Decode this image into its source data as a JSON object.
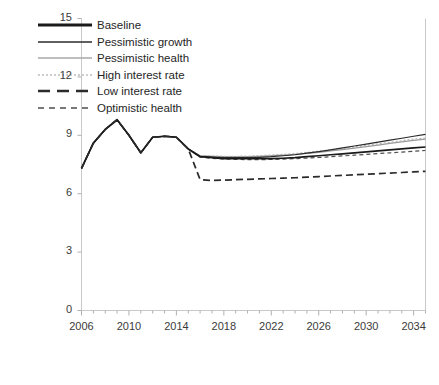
{
  "chart_data": {
    "type": "line",
    "title": "",
    "xlabel": "",
    "ylabel": "",
    "xlim": [
      2006,
      2035
    ],
    "ylim": [
      0,
      15
    ],
    "yticks": [
      0,
      3,
      6,
      9,
      12,
      15
    ],
    "xticks": [
      2006,
      2010,
      2014,
      2018,
      2022,
      2026,
      2030,
      2034
    ],
    "xtick_minor_step": 1,
    "grid": false,
    "legend_position": "top-left",
    "x": [
      2006,
      2007,
      2008,
      2009,
      2010,
      2011,
      2012,
      2013,
      2014,
      2015,
      2016,
      2017,
      2018,
      2019,
      2020,
      2021,
      2022,
      2023,
      2024,
      2025,
      2026,
      2027,
      2028,
      2029,
      2030,
      2031,
      2032,
      2033,
      2034,
      2035
    ],
    "series": [
      {
        "name": "Baseline",
        "color": "#1a1a1a",
        "width": 1.7,
        "dash": "none",
        "values": [
          7.3,
          8.6,
          9.3,
          9.8,
          9.0,
          8.1,
          8.9,
          8.95,
          8.9,
          8.3,
          7.9,
          7.85,
          7.8,
          7.8,
          7.8,
          7.8,
          7.8,
          7.82,
          7.85,
          7.9,
          7.95,
          8.0,
          8.05,
          8.1,
          8.15,
          8.2,
          8.25,
          8.3,
          8.35,
          8.4
        ]
      },
      {
        "name": "Pessimistic growth",
        "color": "#2b2b2b",
        "width": 1.2,
        "dash": "none",
        "values": [
          7.3,
          8.6,
          9.3,
          9.8,
          9.0,
          8.1,
          8.9,
          8.95,
          8.9,
          8.3,
          7.92,
          7.88,
          7.85,
          7.85,
          7.85,
          7.87,
          7.9,
          7.95,
          8.0,
          8.08,
          8.16,
          8.25,
          8.35,
          8.45,
          8.55,
          8.65,
          8.75,
          8.85,
          8.95,
          9.05
        ]
      },
      {
        "name": "Pessimistic health",
        "color": "#9a9a9a",
        "width": 1.3,
        "dash": "none",
        "values": [
          7.3,
          8.6,
          9.3,
          9.8,
          9.0,
          8.1,
          8.9,
          8.95,
          8.9,
          8.3,
          7.95,
          7.92,
          7.9,
          7.9,
          7.9,
          7.92,
          7.95,
          7.98,
          8.02,
          8.07,
          8.13,
          8.2,
          8.27,
          8.34,
          8.42,
          8.5,
          8.58,
          8.66,
          8.74,
          8.8
        ]
      },
      {
        "name": "High interest rate",
        "color": "#b5b5b5",
        "width": 1.3,
        "dash": "2,2",
        "values": [
          7.3,
          8.6,
          9.3,
          9.8,
          9.0,
          8.1,
          8.9,
          8.95,
          8.9,
          8.3,
          7.96,
          7.93,
          7.92,
          7.92,
          7.93,
          7.95,
          7.98,
          8.02,
          8.06,
          8.12,
          8.18,
          8.25,
          8.32,
          8.4,
          8.48,
          8.56,
          8.64,
          8.72,
          8.8,
          8.86
        ]
      },
      {
        "name": "Low interest rate",
        "color": "#2b2b2b",
        "width": 1.7,
        "dash": "7,4",
        "values": [
          7.3,
          8.6,
          9.3,
          9.8,
          9.0,
          8.1,
          8.9,
          8.95,
          8.9,
          8.3,
          6.72,
          6.68,
          6.7,
          6.72,
          6.74,
          6.76,
          6.78,
          6.8,
          6.82,
          6.85,
          6.88,
          6.91,
          6.94,
          6.97,
          7.0,
          7.03,
          7.06,
          7.09,
          7.12,
          7.15
        ]
      },
      {
        "name": "Optimistic health",
        "color": "#4d4d4d",
        "width": 1.2,
        "dash": "4,3",
        "values": [
          7.3,
          8.6,
          9.3,
          9.8,
          9.0,
          8.1,
          8.9,
          8.95,
          8.9,
          8.3,
          7.88,
          7.82,
          7.78,
          7.76,
          7.75,
          7.75,
          7.76,
          7.78,
          7.8,
          7.83,
          7.86,
          7.9,
          7.94,
          7.98,
          8.02,
          8.06,
          8.1,
          8.14,
          8.18,
          8.22
        ]
      }
    ]
  },
  "legend": {
    "items": [
      {
        "label": "Baseline",
        "color": "#1a1a1a",
        "width": 3.0,
        "dash": "none"
      },
      {
        "label": "Pessimistic growth",
        "color": "#2b2b2b",
        "width": 1.4,
        "dash": "none"
      },
      {
        "label": "Pessimistic health",
        "color": "#a8a8a8",
        "width": 1.4,
        "dash": "none"
      },
      {
        "label": "High interest rate",
        "color": "#bdbdbd",
        "width": 1.4,
        "dash": "2,2"
      },
      {
        "label": "Low interest rate",
        "color": "#2b2b2b",
        "width": 2.4,
        "dash": "12,7"
      },
      {
        "label": "Optimistic health",
        "color": "#4d4d4d",
        "width": 1.6,
        "dash": "6,5"
      }
    ]
  },
  "axes": {
    "frame_color": "#c9c9c9",
    "tick_color": "#b0b0b0",
    "label_color": "#3b3b3b"
  }
}
